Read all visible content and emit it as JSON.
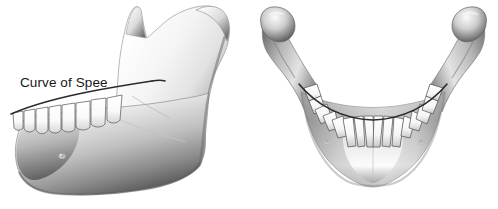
{
  "figure": {
    "background_color": "#ffffff",
    "width": 498,
    "height": 209
  },
  "panels": [
    {
      "id": "curve-of-spee",
      "caption": "Curve of Spee",
      "view": "lateral view of mandible",
      "subject": "mandible",
      "caption_color": "#161616",
      "curve_line_color": "#2b2b2b",
      "bone_light": "#fdfdfd",
      "bone_mid": "#c9c9c9",
      "bone_dark": "#6e6e6e",
      "tooth_color": "#fbfbfb"
    },
    {
      "id": "curve-of-wilson",
      "caption": "Curve of Wilson",
      "view": "anterior view of mandible",
      "subject": "mandible",
      "caption_color": "#161616",
      "curve_line_color": "#2b2b2b",
      "bone_light": "#fdfdfd",
      "bone_mid": "#bcbcbc",
      "bone_dark": "#4a4a4a",
      "tooth_color": "#fbfbfb"
    }
  ]
}
